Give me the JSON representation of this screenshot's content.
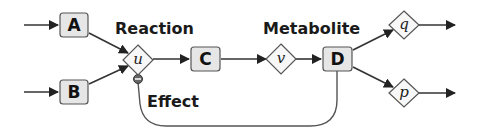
{
  "colors": {
    "background": "#ffffff",
    "box_fill": "#e6e6e6",
    "box_stroke": "#555555",
    "diamond_fill": "#f7f7f7",
    "edge": "#333333",
    "inhibitor_fill": "#666666"
  },
  "labels": {
    "reaction": "Reaction",
    "metabolite": "Metabolite",
    "effect": "Effect"
  },
  "metabolites": [
    {
      "id": "A",
      "label": "A"
    },
    {
      "id": "B",
      "label": "B"
    },
    {
      "id": "C",
      "label": "C"
    },
    {
      "id": "D",
      "label": "D"
    }
  ],
  "reactions": [
    {
      "id": "u",
      "label": "u"
    },
    {
      "id": "v",
      "label": "v"
    },
    {
      "id": "q",
      "label": "q"
    },
    {
      "id": "p",
      "label": "p"
    }
  ],
  "edges": [
    {
      "from": "input",
      "to": "A",
      "type": "arrow"
    },
    {
      "from": "input",
      "to": "B",
      "type": "arrow"
    },
    {
      "from": "A",
      "to": "u",
      "type": "arrow"
    },
    {
      "from": "B",
      "to": "u",
      "type": "arrow"
    },
    {
      "from": "u",
      "to": "C",
      "type": "arrow"
    },
    {
      "from": "C",
      "to": "v",
      "type": "arrow"
    },
    {
      "from": "v",
      "to": "D",
      "type": "arrow"
    },
    {
      "from": "D",
      "to": "q",
      "type": "arrow"
    },
    {
      "from": "D",
      "to": "p",
      "type": "arrow"
    },
    {
      "from": "q",
      "to": "output",
      "type": "arrow"
    },
    {
      "from": "p",
      "to": "output",
      "type": "arrow"
    },
    {
      "from": "D",
      "to": "u",
      "type": "inhibition"
    }
  ]
}
